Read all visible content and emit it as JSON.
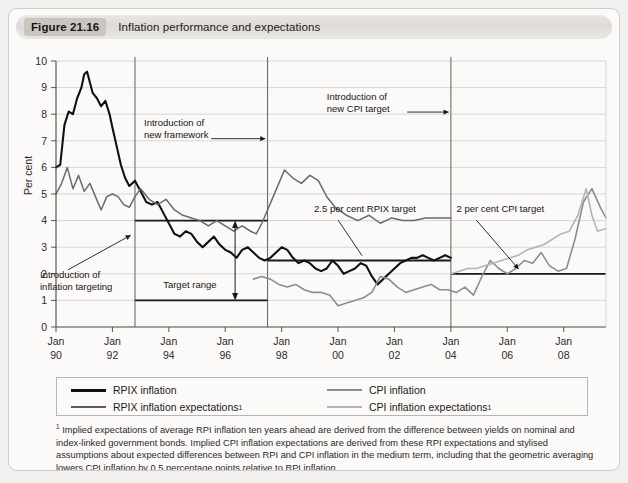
{
  "figure": {
    "number": "Figure 21.16",
    "title": "Inflation performance and expectations"
  },
  "chart_data": {
    "type": "line",
    "title": "Inflation performance and expectations",
    "xlabel": "",
    "ylabel": "Per cent",
    "ylim": [
      0,
      10
    ],
    "xlim": [
      1990.0,
      2009.5
    ],
    "grid": true,
    "legend_position": "bottom",
    "ytick_labels": [
      "0",
      "1",
      "2",
      "3",
      "4",
      "5",
      "6",
      "7",
      "8",
      "9",
      "10"
    ],
    "ytick_values": [
      0,
      1,
      2,
      3,
      4,
      5,
      6,
      7,
      8,
      9,
      10
    ],
    "xtick_labels": [
      {
        "line1": "Jan",
        "line2": "90"
      },
      {
        "line1": "Jan",
        "line2": "92"
      },
      {
        "line1": "Jan",
        "line2": "94"
      },
      {
        "line1": "Jan",
        "line2": "96"
      },
      {
        "line1": "Jan",
        "line2": "98"
      },
      {
        "line1": "Jan",
        "line2": "00"
      },
      {
        "line1": "Jan",
        "line2": "02"
      },
      {
        "line1": "Jan",
        "line2": "04"
      },
      {
        "line1": "Jan",
        "line2": "06"
      },
      {
        "line1": "Jan",
        "line2": "08"
      }
    ],
    "xtick_values": [
      1990,
      1992,
      1994,
      1996,
      1998,
      2000,
      2002,
      2004,
      2006,
      2008
    ],
    "series": [
      {
        "name": "RPIX inflation",
        "color": "#111111",
        "width": 2.1,
        "x": [
          1990.0,
          1990.15,
          1990.3,
          1990.45,
          1990.6,
          1990.75,
          1990.9,
          1991.0,
          1991.1,
          1991.2,
          1991.3,
          1991.45,
          1991.6,
          1991.75,
          1991.9,
          1992.0,
          1992.15,
          1992.3,
          1992.45,
          1992.6,
          1992.8,
          1993.0,
          1993.2,
          1993.4,
          1993.6,
          1993.8,
          1994.0,
          1994.2,
          1994.4,
          1994.6,
          1994.8,
          1995.0,
          1995.2,
          1995.4,
          1995.6,
          1995.8,
          1996.0,
          1996.2,
          1996.4,
          1996.6,
          1996.8,
          1997.0,
          1997.2,
          1997.4,
          1997.6,
          1997.8,
          1998.0,
          1998.2,
          1998.4,
          1998.6,
          1998.8,
          1999.0,
          1999.2,
          1999.4,
          1999.6,
          1999.8,
          2000.0,
          2000.2,
          2000.4,
          2000.6,
          2000.8,
          2001.0,
          2001.2,
          2001.4,
          2001.6,
          2001.8,
          2002.0,
          2002.2,
          2002.4,
          2002.6,
          2002.8,
          2003.0,
          2003.2,
          2003.4,
          2003.6,
          2003.8,
          2004.0
        ],
        "y": [
          6.0,
          6.1,
          7.6,
          8.1,
          8.0,
          8.6,
          9.0,
          9.5,
          9.6,
          9.2,
          8.8,
          8.6,
          8.3,
          8.5,
          8.0,
          7.5,
          6.8,
          6.1,
          5.6,
          5.3,
          5.5,
          5.1,
          4.7,
          4.6,
          4.7,
          4.3,
          3.9,
          3.5,
          3.4,
          3.6,
          3.5,
          3.2,
          3.0,
          3.2,
          3.4,
          3.1,
          2.9,
          2.8,
          2.6,
          2.9,
          3.0,
          2.8,
          2.6,
          2.5,
          2.6,
          2.8,
          3.0,
          2.9,
          2.6,
          2.4,
          2.5,
          2.4,
          2.2,
          2.1,
          2.2,
          2.5,
          2.3,
          2.0,
          2.1,
          2.2,
          2.4,
          2.3,
          1.9,
          1.6,
          1.8,
          2.0,
          2.2,
          2.4,
          2.5,
          2.6,
          2.6,
          2.7,
          2.6,
          2.5,
          2.6,
          2.7,
          2.6
        ]
      },
      {
        "name": "RPIX inflation expectations",
        "color": "#6a6a6a",
        "width": 1.5,
        "x": [
          1990.0,
          1990.2,
          1990.4,
          1990.6,
          1990.8,
          1991.0,
          1991.2,
          1991.4,
          1991.6,
          1991.8,
          1992.0,
          1992.2,
          1992.4,
          1992.6,
          1992.8,
          1993.0,
          1993.3,
          1993.6,
          1993.9,
          1994.2,
          1994.5,
          1994.8,
          1995.1,
          1995.4,
          1995.7,
          1996.0,
          1996.3,
          1996.6,
          1996.9,
          1997.1,
          1997.3,
          1997.5,
          1997.7,
          1997.9,
          1998.1,
          1998.4,
          1998.7,
          1999.0,
          1999.3,
          1999.6,
          1999.9,
          2000.3,
          2000.7,
          2001.1,
          2001.5,
          2001.9,
          2002.3,
          2002.7,
          2003.1,
          2003.5,
          2003.9,
          2004.0
        ],
        "y": [
          5.0,
          5.4,
          6.0,
          5.2,
          5.7,
          5.1,
          5.4,
          4.9,
          4.4,
          4.9,
          5.0,
          4.9,
          4.6,
          4.5,
          4.9,
          5.2,
          4.8,
          4.6,
          4.8,
          4.4,
          4.2,
          4.1,
          4.0,
          3.8,
          4.0,
          3.8,
          3.6,
          3.8,
          3.6,
          3.5,
          3.9,
          4.4,
          4.9,
          5.4,
          5.9,
          5.6,
          5.4,
          5.7,
          5.5,
          4.9,
          4.5,
          4.2,
          4.0,
          4.2,
          3.9,
          4.1,
          4.0,
          4.0,
          4.1,
          4.1,
          4.1,
          4.1
        ]
      },
      {
        "name": "CPI inflation",
        "color": "#8d8d8d",
        "width": 1.6,
        "x": [
          1997.0,
          1997.3,
          1997.6,
          1997.9,
          1998.2,
          1998.5,
          1998.8,
          1999.1,
          1999.4,
          1999.7,
          2000.0,
          2000.3,
          2000.6,
          2000.9,
          2001.2,
          2001.5,
          2001.8,
          2002.1,
          2002.4,
          2002.7,
          2003.0,
          2003.3,
          2003.6,
          2003.9,
          2004.2,
          2004.5,
          2004.8,
          2005.1,
          2005.4,
          2005.7,
          2006.0,
          2006.3,
          2006.6,
          2006.9,
          2007.2,
          2007.5,
          2007.8,
          2008.1,
          2008.4,
          2008.7,
          2009.0,
          2009.3,
          2009.5
        ],
        "y": [
          1.8,
          1.9,
          1.8,
          1.6,
          1.5,
          1.6,
          1.4,
          1.3,
          1.3,
          1.2,
          0.8,
          0.9,
          1.0,
          1.1,
          1.3,
          1.9,
          1.8,
          1.5,
          1.3,
          1.4,
          1.5,
          1.6,
          1.4,
          1.4,
          1.3,
          1.5,
          1.2,
          1.9,
          2.5,
          2.2,
          2.0,
          2.2,
          2.5,
          2.4,
          2.8,
          2.3,
          2.1,
          2.2,
          3.3,
          4.7,
          5.2,
          4.5,
          4.1
        ]
      },
      {
        "name": "CPI inflation expectations",
        "color": "#b4b4b4",
        "width": 1.6,
        "x": [
          2004.0,
          2004.3,
          2004.6,
          2004.9,
          2005.2,
          2005.5,
          2005.8,
          2006.1,
          2006.4,
          2006.7,
          2007.0,
          2007.3,
          2007.6,
          2007.9,
          2008.2,
          2008.5,
          2008.8,
          2009.0,
          2009.2,
          2009.5
        ],
        "y": [
          2.0,
          2.1,
          2.2,
          2.2,
          2.3,
          2.4,
          2.5,
          2.6,
          2.7,
          2.9,
          3.0,
          3.1,
          3.3,
          3.5,
          3.6,
          4.2,
          5.2,
          4.2,
          3.6,
          3.7
        ]
      }
    ],
    "reference_lines": [
      {
        "name": "target-range-upper",
        "value": 4.0,
        "x_from": 1992.8,
        "x_to": 1997.5
      },
      {
        "name": "target-range-lower",
        "value": 1.0,
        "x_from": 1992.8,
        "x_to": 1997.5
      },
      {
        "name": "rpix-target-2.5",
        "value": 2.5,
        "x_from": 1997.5,
        "x_to": 2004.0
      },
      {
        "name": "cpi-target-2.0",
        "value": 2.0,
        "x_from": 2004.0,
        "x_to": 2009.5
      }
    ],
    "vertical_markers": [
      {
        "name": "introduction-of-inflation-targeting",
        "x": 1992.8
      },
      {
        "name": "introduction-of-new-framework",
        "x": 1997.5
      },
      {
        "name": "introduction-of-new-cpi-target",
        "x": 2004.0
      }
    ],
    "annotations": [
      {
        "name": "introduction-of-inflation-targeting",
        "line1": "Introduction of",
        "line2": "inflation targeting"
      },
      {
        "name": "introduction-of-new-framework",
        "line1": "Introduction of",
        "line2": "new framework"
      },
      {
        "name": "introduction-of-new-cpi-target",
        "line1": "Introduction of",
        "line2": "new CPI target"
      },
      {
        "name": "target-range",
        "line1": "Target range",
        "line2": ""
      },
      {
        "name": "rpix-target-label",
        "line1": "2.5 per cent RPIX target",
        "line2": ""
      },
      {
        "name": "cpi-target-label",
        "line1": "2 per cent CPI target",
        "line2": ""
      }
    ]
  },
  "legend": [
    {
      "label": "RPIX inflation",
      "note": "",
      "color": "#111111"
    },
    {
      "label": "RPIX inflation expectations",
      "note": "1",
      "color": "#5d5d5d"
    },
    {
      "label": "CPI inflation",
      "note": "",
      "color": "#8d8d8d"
    },
    {
      "label": "CPI inflation expectations",
      "note": "1",
      "color": "#b4b4b4"
    }
  ],
  "footnote": {
    "mark": "1",
    "text": "Implied expectations of average RPI inflation ten years ahead are derived from the difference between yields on nominal and index-linked government bonds. Implied CPI inflation expectations are derived from these RPI expectations and stylised assumptions about expected differences between RPI and CPI inflation in the medium term, including that the geometric averaging lowers CPI inflation by 0.5 percentage points relative to RPI inflation."
  }
}
